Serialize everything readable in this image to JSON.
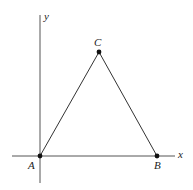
{
  "diagram": {
    "type": "coordinate-triangle",
    "axes": {
      "x_label": "x",
      "y_label": "y"
    },
    "points": [
      {
        "name": "A",
        "label": "A"
      },
      {
        "name": "B",
        "label": "B"
      },
      {
        "name": "C",
        "label": "C"
      }
    ],
    "colors": {
      "line": "#333333",
      "point": "#111111",
      "background": "#ffffff"
    }
  }
}
